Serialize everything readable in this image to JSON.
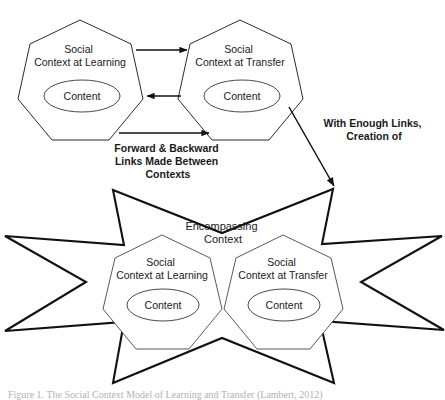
{
  "figure": {
    "background_color": "#ffffff",
    "line_color": "#111111",
    "shape_fill": "#ffffff"
  },
  "top_section": {
    "left_node": {
      "label_line1": "Social",
      "label_line2": "Context at Learning",
      "inner_label": "Content"
    },
    "right_node": {
      "label_line1": "Social",
      "label_line2": "Context at Transfer",
      "inner_label": "Content"
    },
    "arrows": {
      "forward_top": "arrow-right",
      "backward_middle": "arrow-left",
      "forward_bottom": "arrow-right"
    }
  },
  "annotations": {
    "links_label": {
      "line1": "Forward & Backward",
      "line2": "Links Made Between",
      "line3": "Contexts"
    },
    "creation_label": {
      "line1": "With Enough Links,",
      "line2": "Creation of"
    }
  },
  "bottom_section": {
    "encompassing_label": {
      "line1": "Encompassing",
      "line2": "Context"
    },
    "left_node": {
      "label_line1": "Social",
      "label_line2": "Context at Learning",
      "inner_label": "Content"
    },
    "right_node": {
      "label_line1": "Social",
      "label_line2": "Context at Transfer",
      "inner_label": "Content"
    }
  },
  "caption": {
    "text": "Figure 1.  The Social Context Model of Learning and Transfer  (Lambert,  2012)"
  }
}
